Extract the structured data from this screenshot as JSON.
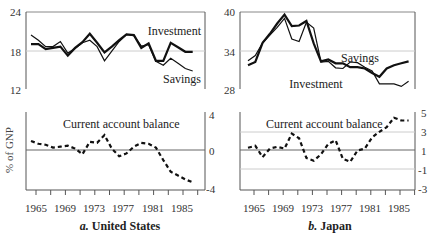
{
  "chart_data": [
    {
      "type": "line",
      "panel": "a-top",
      "title": "",
      "xlabel": "",
      "ylabel": "% of GNP",
      "ylim": [
        12,
        24
      ],
      "yticks": [
        24,
        18,
        12
      ],
      "grid_lines": [
        18
      ],
      "x": [
        1965,
        1966,
        1967,
        1968,
        1969,
        1970,
        1971,
        1972,
        1973,
        1974,
        1975,
        1976,
        1977,
        1978,
        1979,
        1980,
        1981,
        1982,
        1983,
        1984,
        1985,
        1986,
        1987
      ],
      "series": [
        {
          "name": "Investment",
          "values": [
            19.0,
            19.0,
            18.2,
            18.4,
            18.6,
            17.2,
            18.4,
            19.3,
            20.6,
            19.2,
            17.7,
            18.6,
            19.6,
            20.5,
            20.4,
            18.4,
            19.1,
            16.4,
            16.4,
            19.2,
            18.5,
            17.8,
            17.8
          ]
        },
        {
          "name": "Savings",
          "values": [
            20.4,
            19.6,
            18.6,
            18.6,
            19.4,
            17.6,
            18.3,
            19.2,
            19.6,
            18.6,
            16.4,
            17.9,
            19.4,
            20.5,
            20.3,
            18.7,
            18.9,
            16.3,
            15.7,
            16.8,
            16.0,
            15.2,
            14.8
          ]
        }
      ],
      "annotations": [
        "Investment",
        "Savings"
      ]
    },
    {
      "type": "line",
      "panel": "a-bottom",
      "title": "Current account balance",
      "ylabel": "% of GNP",
      "ylim": [
        -4,
        4
      ],
      "yticks": [
        4,
        0,
        -4
      ],
      "zero_line": 0,
      "x": [
        1965,
        1966,
        1967,
        1968,
        1969,
        1970,
        1971,
        1972,
        1973,
        1974,
        1975,
        1976,
        1977,
        1978,
        1979,
        1980,
        1981,
        1982,
        1983,
        1984,
        1985,
        1986,
        1987
      ],
      "series": [
        {
          "name": "Current account balance",
          "style": "dashed",
          "values": [
            1.0,
            0.7,
            0.6,
            0.3,
            0.4,
            0.5,
            0.2,
            -0.4,
            0.9,
            0.8,
            1.6,
            0.2,
            -0.6,
            -0.3,
            0.4,
            0.8,
            0.7,
            0.3,
            -1.0,
            -2.2,
            -2.6,
            -3.0,
            -3.3
          ]
        }
      ],
      "xticklabels": [
        "1965",
        "1969",
        "1973",
        "1977",
        "1981",
        "1985"
      ],
      "caption": "a. United States"
    },
    {
      "type": "line",
      "panel": "b-top",
      "title": "",
      "ylim": [
        28,
        40
      ],
      "yticks": [
        40,
        34,
        28
      ],
      "grid_lines": [
        34
      ],
      "x": [
        1965,
        1966,
        1967,
        1968,
        1969,
        1970,
        1971,
        1972,
        1973,
        1974,
        1975,
        1976,
        1977,
        1978,
        1979,
        1980,
        1981,
        1982,
        1983,
        1984,
        1985,
        1986,
        1987
      ],
      "series": [
        {
          "name": "Savings",
          "values": [
            31.7,
            32.2,
            35.2,
            36.6,
            38.2,
            39.6,
            37.8,
            37.9,
            38.6,
            35.1,
            32.3,
            32.6,
            32.0,
            32.0,
            31.4,
            31.4,
            31.2,
            30.5,
            29.9,
            31.2,
            31.7,
            32.0,
            32.3
          ]
        },
        {
          "name": "Investment",
          "values": [
            32.4,
            33.2,
            35.2,
            36.4,
            37.6,
            39.0,
            35.8,
            35.4,
            38.4,
            37.5,
            32.2,
            32.3,
            31.3,
            31.2,
            32.2,
            32.1,
            31.4,
            30.8,
            28.8,
            28.8,
            28.8,
            28.4,
            29.2
          ]
        }
      ],
      "annotations": [
        "Savings",
        "Investment"
      ]
    },
    {
      "type": "line",
      "panel": "b-bottom",
      "title": "Current account balance",
      "ylim": [
        -3,
        5
      ],
      "yticks": [
        5,
        3,
        1,
        -1,
        -3
      ],
      "grid_lines": [
        3,
        -1
      ],
      "zero_line": 1,
      "x": [
        1965,
        1966,
        1967,
        1968,
        1969,
        1970,
        1971,
        1972,
        1973,
        1974,
        1975,
        1976,
        1977,
        1978,
        1979,
        1980,
        1981,
        1982,
        1983,
        1984,
        1985,
        1986,
        1987
      ],
      "series": [
        {
          "name": "Current account balance",
          "style": "dashed",
          "values": [
            1.3,
            1.5,
            0.3,
            1.2,
            1.4,
            1.2,
            2.8,
            2.3,
            0.2,
            -0.1,
            0.6,
            1.7,
            2.1,
            0.1,
            -0.2,
            1.0,
            1.2,
            2.4,
            3.0,
            3.5,
            4.5,
            4.2,
            4.2
          ]
        }
      ],
      "xticklabels": [
        "1965",
        "1969",
        "1973",
        "1977",
        "1981",
        "1985"
      ],
      "caption": "b. Japan"
    }
  ],
  "labels": {
    "us_top_y": [
      "24",
      "18",
      "12"
    ],
    "us_bottom_y": [
      "4",
      "0",
      "-4"
    ],
    "jp_top_y": [
      "40",
      "34",
      "28"
    ],
    "jp_bottom_y": [
      "5",
      "3",
      "1",
      "-1",
      "-3"
    ],
    "x_ticks": [
      "1965",
      "1969",
      "1973",
      "1977",
      "1981",
      "1985"
    ],
    "y_axis_title": "% of GNP",
    "us_investment": "Investment",
    "us_savings": "Savings",
    "jp_savings": "Savings",
    "jp_investment": "Investment",
    "current_account": "Current account balance",
    "caption_a_prefix": "a.",
    "caption_a": "United States",
    "caption_b_prefix": "b.",
    "caption_b": "Japan"
  }
}
